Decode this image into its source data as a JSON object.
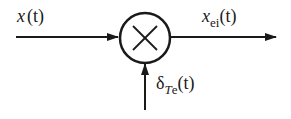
{
  "diagram": {
    "type": "multiplier-block",
    "input": {
      "label_var": "x",
      "label_arg": "(t)"
    },
    "output": {
      "label_var": "x",
      "label_sub": "ei",
      "label_arg": "(t)"
    },
    "side_input": {
      "label_var": "δ",
      "label_sub_italic": "T",
      "label_sub": "e",
      "label_arg": "(t)"
    },
    "operator_symbol": "×",
    "colors": {
      "stroke": "#1a1a1a",
      "background": "#ffffff"
    }
  }
}
